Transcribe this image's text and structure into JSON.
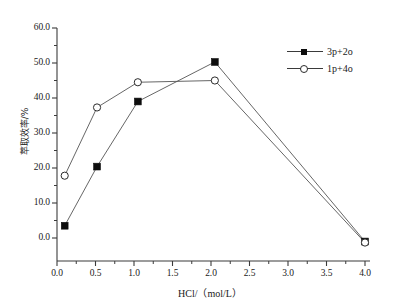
{
  "chart_data": {
    "type": "line",
    "title": "",
    "xlabel": "HCl/（mol/L）",
    "ylabel": "萃取效率/%",
    "xlim": [
      0.0,
      4.0
    ],
    "ylim": [
      -3.0,
      60.0
    ],
    "grid": false,
    "legend_position": "top-right",
    "xticks": [
      "0.0",
      "0.5",
      "1.0",
      "1.5",
      "2.0",
      "2.5",
      "3.0",
      "3.5",
      "4.0"
    ],
    "xtick_values": [
      0.0,
      0.5,
      1.0,
      1.5,
      2.0,
      2.5,
      3.0,
      3.5,
      4.0
    ],
    "yticks": [
      "0.0",
      "10.0",
      "20.0",
      "30.0",
      "40.0",
      "50.0",
      "60.0"
    ],
    "ytick_values": [
      0.0,
      10.0,
      20.0,
      30.0,
      40.0,
      50.0,
      60.0
    ],
    "series": [
      {
        "name": "3p+2o",
        "marker": "filled-square",
        "color": "#0d0d0d",
        "x": [
          0.1,
          0.52,
          1.05,
          2.05,
          4.0
        ],
        "values": [
          3.5,
          20.4,
          39.0,
          50.3,
          -1.0
        ]
      },
      {
        "name": "1p+4o",
        "marker": "open-circle",
        "color": "#2b2b2b",
        "x": [
          0.1,
          0.52,
          1.05,
          2.05,
          4.0
        ],
        "values": [
          17.8,
          37.3,
          44.5,
          45.0,
          -1.3
        ]
      }
    ]
  },
  "legend": {
    "entries": [
      {
        "label": "3p+2o",
        "marker": "filled-square"
      },
      {
        "label": "1p+4o",
        "marker": "open-circle"
      }
    ]
  },
  "axes": {
    "x_title": "HCl/（mol/L）",
    "y_title": "萃取效率/%"
  }
}
